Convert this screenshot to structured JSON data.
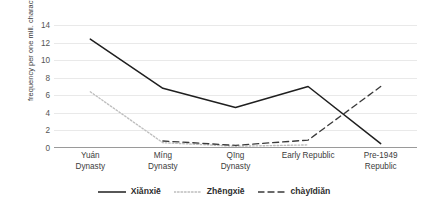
{
  "chart_data": {
    "type": "line",
    "title": "",
    "xlabel": "",
    "ylabel": "frequency per one mill. characters",
    "ylim": [
      0,
      14
    ],
    "yticks": [
      0,
      2,
      4,
      6,
      8,
      10,
      12,
      14
    ],
    "grid": true,
    "legend_position": "bottom-center",
    "categories": [
      "Yuán Dynasty",
      "Míng Dynasty",
      "Qīng Dynasty",
      "Early Republic",
      "Pre-1949 Republic"
    ],
    "series": [
      {
        "name": "Xiǎnxiē",
        "style": "solid",
        "color": "#1f1f1f",
        "values": [
          12.4,
          6.8,
          4.6,
          7.0,
          0.5
        ]
      },
      {
        "name": "Zhēngxiē",
        "style": "dotted",
        "color": "#bdbdbd",
        "values": [
          6.4,
          0.6,
          0.2,
          0.35,
          null
        ]
      },
      {
        "name": "chàyīdiǎn",
        "style": "dashed",
        "color": "#3a3a3a",
        "values": [
          null,
          0.8,
          0.3,
          0.9,
          7.0
        ]
      }
    ]
  },
  "axis": {
    "y_title": "frequency per one mill. characters",
    "y_tick_labels": [
      "14",
      "12",
      "10",
      "8",
      "6",
      "4",
      "2",
      "0"
    ],
    "x_tick_lines": [
      [
        "Yuán",
        "Dynasty"
      ],
      [
        "Míng",
        "Dynasty"
      ],
      [
        "Qīng",
        "Dynasty"
      ],
      [
        "Early Republic",
        ""
      ],
      [
        "Pre-1949",
        "Republic"
      ]
    ]
  },
  "legend": {
    "items": [
      {
        "label": "Xiǎnxiē",
        "style": "solid"
      },
      {
        "label": "Zhēngxiē",
        "style": "dotted"
      },
      {
        "label": "chàyīdiǎn",
        "style": "dashed"
      }
    ]
  },
  "colors": {
    "series_solid": "#1f1f1f",
    "series_dotted": "#bdbdbd",
    "series_dashed": "#3a3a3a",
    "gridline": "#e9e9e9",
    "axis": "#9a9a9a",
    "text": "#3c3c3c",
    "background": "#ffffff"
  }
}
